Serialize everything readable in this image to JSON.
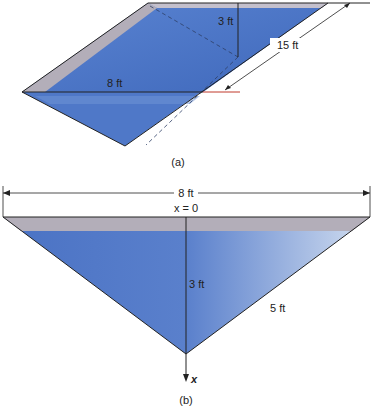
{
  "figure_a": {
    "caption": "(a)",
    "labels": {
      "depth": "3 ft",
      "length": "15 ft",
      "width": "8 ft"
    }
  },
  "figure_b": {
    "caption": "(b)",
    "labels": {
      "width": "8 ft",
      "origin": "x = 0",
      "depth": "3 ft",
      "side": "5 ft",
      "axis": "x"
    }
  },
  "colors": {
    "water_dark": "#4a72c4",
    "water_light": "#c8d8ee",
    "rim": "#b3aeb9",
    "outline": "#222222",
    "accent_line": "#c0392b"
  }
}
